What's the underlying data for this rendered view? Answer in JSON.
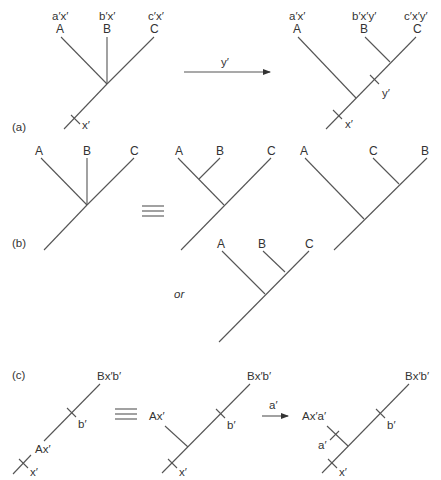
{
  "figure": {
    "panels": {
      "a": {
        "label": "(a)",
        "before_tree": {
          "taxa": [
            "A",
            "B",
            "C"
          ],
          "characters": [
            "a′x′",
            "b′x′",
            "c′x′"
          ],
          "root_character": "x′"
        },
        "transition": {
          "label": "y′"
        },
        "after_tree": {
          "taxa": [
            "A",
            "B",
            "C"
          ],
          "characters": [
            "a′x′",
            "b′x′y′",
            "c′x′y′"
          ],
          "root_character": "x′",
          "internal_character": "y′"
        }
      },
      "b": {
        "label": "(b)",
        "star_tree": {
          "taxa": [
            "A",
            "B",
            "C"
          ]
        },
        "equivalence_symbol": "≡",
        "resolved_tree_1": {
          "taxa": [
            "A",
            "B",
            "C"
          ]
        },
        "resolved_tree_2": {
          "taxa": [
            "A",
            "C",
            "B"
          ]
        },
        "resolved_tree_3": {
          "taxa": [
            "A",
            "B",
            "C"
          ]
        },
        "or_label": "or"
      },
      "c": {
        "label": "(c)",
        "tree_1": {
          "top_label": "Bx′b′",
          "mid_label": "Ax′",
          "tick_b": "b′",
          "tick_x": "x′"
        },
        "equivalence_symbol": "≡",
        "tree_2": {
          "top_label": "Bx′b′",
          "side_label": "Ax′",
          "tick_b": "b′",
          "tick_x": "x′"
        },
        "transition": {
          "label": "a′"
        },
        "tree_3": {
          "top_label": "Bx′b′",
          "side_label": "Ax′a′",
          "tick_a": "a′",
          "tick_b": "b′",
          "tick_x": "x′"
        }
      }
    }
  }
}
